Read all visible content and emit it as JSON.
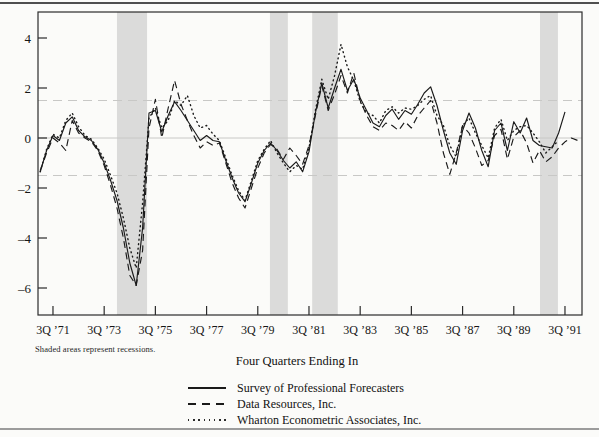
{
  "page": {
    "note": "Shaded areas represent recessions.",
    "xaxis_title": "Four Quarters Ending In"
  },
  "legend": [
    {
      "style": "solid",
      "label": "Survey of Professional Forecasters"
    },
    {
      "style": "dashed",
      "label": "Data Resources, Inc."
    },
    {
      "style": "dotted",
      "label": "Wharton Econometric Associates, Inc."
    }
  ],
  "chart_data": {
    "type": "line",
    "title": "",
    "xlabel": "Four Quarters Ending In",
    "ylabel": "",
    "note": "Shaded areas represent recessions.",
    "x_unit": "quarters since 1971Q3",
    "x_tick_quarters": [
      0,
      8,
      16,
      24,
      32,
      40,
      48,
      56,
      64,
      72,
      80
    ],
    "x_tick_labels": [
      "3Q ’71",
      "3Q ’73",
      "3Q ’75",
      "3Q ’77",
      "3Q ’79",
      "3Q ’81",
      "3Q ’83",
      "3Q ’85",
      "3Q ’87",
      "3Q ’89",
      "3Q ’91"
    ],
    "y_ticks": [
      4,
      2,
      0,
      -2,
      -4,
      -6
    ],
    "xlim": [
      -2.34,
      82.66
    ],
    "ylim": [
      -7.08,
      5.04
    ],
    "grid": {
      "solid_y": [
        0
      ],
      "dashed_y": [
        1.5,
        -1.5
      ]
    },
    "legend_position": "below",
    "recession_bands_quarters": [
      [
        10.0,
        14.7
      ],
      [
        33.9,
        36.7
      ],
      [
        40.5,
        44.5
      ],
      [
        76.1,
        78.9
      ]
    ],
    "series": [
      {
        "name": "Survey of Professional Forecasters",
        "style": "solid",
        "start_quarter": -2,
        "values": [
          -1.35,
          -0.5,
          0.1,
          -0.1,
          0.6,
          0.85,
          0.3,
          0.05,
          -0.1,
          -0.45,
          -1.0,
          -1.7,
          -2.5,
          -3.6,
          -5.0,
          -5.9,
          -3.6,
          1.0,
          1.1,
          0.25,
          0.9,
          1.45,
          1.1,
          0.7,
          0.3,
          -0.1,
          0.1,
          -0.1,
          -0.15,
          -0.9,
          -1.6,
          -2.2,
          -2.55,
          -1.8,
          -1.0,
          -0.5,
          -0.2,
          -0.5,
          -0.9,
          -1.2,
          -0.95,
          -1.35,
          -0.55,
          1.0,
          2.2,
          1.2,
          2.0,
          2.75,
          1.9,
          2.35,
          1.6,
          1.1,
          0.6,
          0.45,
          0.9,
          1.15,
          0.75,
          1.1,
          0.95,
          1.35,
          1.8,
          2.05,
          1.3,
          0.3,
          -0.6,
          -1.05,
          0.3,
          1.0,
          0.4,
          -0.5,
          -1.15,
          0.3,
          0.6,
          -0.5,
          0.65,
          0.2,
          0.8,
          -0.1,
          -0.3,
          -0.35,
          -0.4,
          0.2,
          1.05
        ]
      },
      {
        "name": "Data Resources, Inc.",
        "style": "dashed",
        "start_quarter": -2,
        "values": [
          -1.3,
          -0.6,
          0.0,
          -0.2,
          -0.5,
          0.7,
          0.2,
          0.0,
          -0.15,
          -0.5,
          -1.1,
          -1.9,
          -2.8,
          -4.0,
          -5.5,
          -5.9,
          -4.5,
          0.4,
          1.55,
          0.0,
          1.2,
          2.3,
          1.35,
          0.7,
          0.1,
          -0.4,
          -0.15,
          -0.3,
          -0.2,
          -1.0,
          -1.8,
          -2.4,
          -2.8,
          -2.0,
          -1.2,
          -0.6,
          -0.25,
          -0.45,
          -0.85,
          -0.4,
          -0.7,
          -1.05,
          -0.3,
          0.9,
          2.1,
          1.1,
          1.75,
          2.5,
          1.8,
          2.6,
          1.5,
          0.9,
          0.45,
          0.3,
          0.6,
          0.5,
          0.3,
          0.65,
          0.4,
          0.9,
          1.2,
          1.5,
          0.6,
          -0.6,
          -1.45,
          -0.6,
          0.5,
          0.2,
          -0.4,
          -1.1,
          -0.9,
          0.1,
          0.35,
          -0.85,
          0.05,
          0.3,
          -0.2,
          -1.0,
          -0.5,
          -0.95,
          -0.75,
          -0.4,
          -0.15,
          0.0,
          -0.1
        ]
      },
      {
        "name": "Wharton Econometric Associates, Inc.",
        "style": "dotted",
        "start_quarter": -2,
        "values": [
          -1.35,
          -0.45,
          0.15,
          0.0,
          0.7,
          1.0,
          0.45,
          0.1,
          -0.05,
          -0.4,
          -0.85,
          -1.5,
          -2.2,
          -3.2,
          -4.4,
          -5.2,
          -2.6,
          0.8,
          1.2,
          0.4,
          0.7,
          1.5,
          1.3,
          1.7,
          0.9,
          0.4,
          0.5,
          0.15,
          -0.1,
          -0.8,
          -1.5,
          -2.1,
          -2.5,
          -1.7,
          -0.9,
          -0.45,
          -0.1,
          -0.6,
          -1.0,
          -1.35,
          -1.1,
          -1.25,
          -0.4,
          1.1,
          2.35,
          1.55,
          2.5,
          3.75,
          2.85,
          2.3,
          1.45,
          1.0,
          0.9,
          0.6,
          1.1,
          1.25,
          1.0,
          1.2,
          1.15,
          1.3,
          1.55,
          1.7,
          0.9,
          0.5,
          -0.3,
          -0.75,
          0.5,
          0.8,
          0.2,
          -0.3,
          -0.8,
          0.4,
          0.75,
          -0.1,
          0.3,
          0.45,
          0.5,
          0.2,
          -0.15,
          -0.6,
          -0.35,
          -0.1
        ]
      }
    ],
    "colors": {
      "line": "#1a1a1a",
      "recession_band": "#dbdbda",
      "grid": "#c8c8c6",
      "frame": "#2b2b2b",
      "background": "#fbfbf9"
    }
  }
}
